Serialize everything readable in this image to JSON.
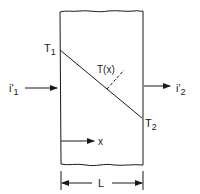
{
  "diagram": {
    "labels": {
      "t1": "T",
      "t1_sub": "1",
      "t2": "T",
      "t2_sub": "2",
      "tx": "T(x)",
      "i1": "i'",
      "i1_sub": "1",
      "i2": "i'",
      "i2_sub": "2",
      "x_axis": "x",
      "length": "L"
    },
    "colors": {
      "stroke": "#1a1a1a",
      "background": "#ffffff"
    }
  }
}
